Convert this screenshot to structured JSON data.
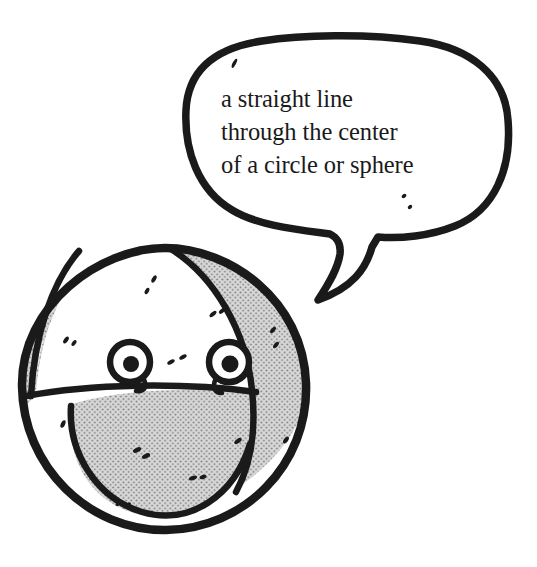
{
  "illustration": {
    "title": "cartoon sphere with speech bubble defining diameter",
    "background_color": "#ffffff",
    "ink_color": "#1a1a1a",
    "halftone_fill_color": "#d5d5d5",
    "halftone_dot_color": "#808080",
    "white_fill_color": "#ffffff"
  },
  "speech_bubble": {
    "name": "speech-bubble",
    "fill_color": "#ffffff",
    "outline_color": "#1a1a1a",
    "text_lines": [
      "a straight line",
      "through the center",
      "of a circle or sphere"
    ],
    "full_text": "a straight line through the center of a circle or sphere",
    "tail_direction": "down-left toward sphere",
    "speckles_count": 3
  },
  "character": {
    "name": "sphere-character",
    "shape": "circle",
    "face": {
      "left_eye": {
        "name": "left-eye",
        "pupil_color": "#1a1a1a",
        "sclera_color": "#ffffff"
      },
      "right_eye": {
        "name": "right-eye",
        "pupil_color": "#1a1a1a",
        "sclera_color": "#ffffff"
      },
      "nose_speckles": 2
    },
    "segments": [
      {
        "name": "left-crescent-segment",
        "fill": "halftone"
      },
      {
        "name": "upper-center-segment",
        "fill": "white"
      },
      {
        "name": "right-crescent-segment",
        "fill": "halftone"
      },
      {
        "name": "lower-dome-segment",
        "fill": "halftone"
      },
      {
        "name": "bottom-rim-segment",
        "fill": "white"
      }
    ],
    "division_lines": [
      {
        "name": "left-great-circle-arc"
      },
      {
        "name": "right-great-circle-arc"
      },
      {
        "name": "equator-arc"
      }
    ],
    "texture_speckles": 14
  }
}
